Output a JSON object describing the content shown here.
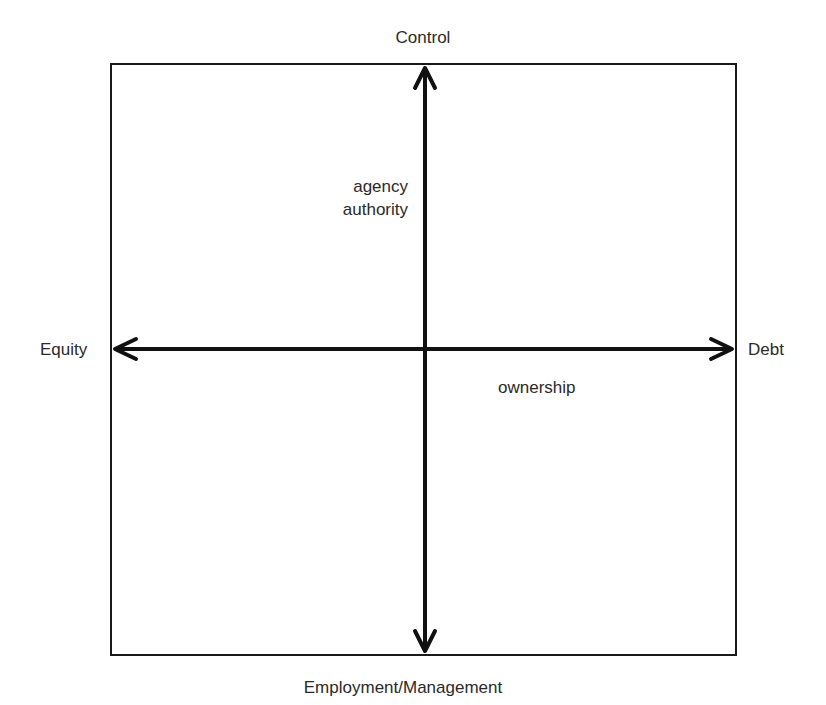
{
  "diagram": {
    "type": "quadrant-axes",
    "axes": {
      "top": "Control",
      "bottom": "Employment/Management",
      "left": "Equity",
      "right": "Debt"
    },
    "annotations": {
      "upper_left_quadrant": [
        "agency",
        "authority"
      ],
      "lower_right_quadrant": "ownership"
    },
    "colors": {
      "line": "#111111",
      "text": "#2a2a2a",
      "background": "#ffffff"
    }
  }
}
